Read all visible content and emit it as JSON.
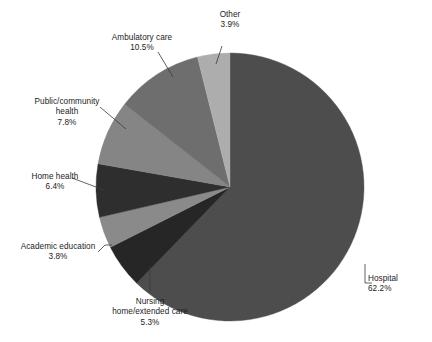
{
  "chart_data": {
    "type": "pie",
    "title": "",
    "subtitle": "",
    "xlabel": "",
    "ylabel": "",
    "legend_position": "none",
    "grid": false,
    "label_style": "external-with-leader-lines",
    "value_unit": "%",
    "start_angle_deg": 0,
    "direction": "clockwise",
    "categories": [
      "Hospital",
      "Nursing home/extended care",
      "Academic education",
      "Home health",
      "Public/community health",
      "Ambulatory care",
      "Other"
    ],
    "values": [
      62.2,
      5.3,
      3.8,
      6.4,
      7.8,
      10.5,
      3.9
    ],
    "colors": [
      "#4d4d4d",
      "#262626",
      "#8a8a8a",
      "#2e2e2e",
      "#858585",
      "#6e6e6e",
      "#adadad"
    ],
    "slices": [
      {
        "label": "Hospital",
        "label_lines": [
          "Hospital",
          "62.2%"
        ],
        "value": 62.2,
        "value_text": "62.2%",
        "color": "#4d4d4d"
      },
      {
        "label": "Nursing home/extended care",
        "label_lines": [
          "Nursing",
          "home/extended care",
          "5.3%"
        ],
        "value": 5.3,
        "value_text": "5.3%",
        "color": "#262626"
      },
      {
        "label": "Academic education",
        "label_lines": [
          "Academic education",
          "3.8%"
        ],
        "value": 3.8,
        "value_text": "3.8%",
        "color": "#8a8a8a"
      },
      {
        "label": "Home health",
        "label_lines": [
          "Home health",
          "6.4%"
        ],
        "value": 6.4,
        "value_text": "6.4%",
        "color": "#2e2e2e"
      },
      {
        "label": "Public/community health",
        "label_lines": [
          "Public/community",
          "health",
          "7.8%"
        ],
        "value": 7.8,
        "value_text": "7.8%",
        "color": "#858585"
      },
      {
        "label": "Ambulatory care",
        "label_lines": [
          "Ambulatory care",
          "10.5%"
        ],
        "value": 10.5,
        "value_text": "10.5%",
        "color": "#6e6e6e"
      },
      {
        "label": "Other",
        "label_lines": [
          "Other",
          "3.9%"
        ],
        "value": 3.9,
        "value_text": "3.9%",
        "color": "#adadad"
      }
    ]
  },
  "labels": {
    "hospital": {
      "line1": "Hospital",
      "line2": "62.2%"
    },
    "nursing": {
      "line1": "Nursing",
      "line2": "home/extended care",
      "line3": "5.3%"
    },
    "academic": {
      "line1": "Academic education",
      "line2": "3.8%"
    },
    "home": {
      "line1": "Home health",
      "line2": "6.4%"
    },
    "public": {
      "line1": "Public/community",
      "line2": "health",
      "line3": "7.8%"
    },
    "ambulatory": {
      "line1": "Ambulatory care",
      "line2": "10.5%"
    },
    "other": {
      "line1": "Other",
      "line2": "3.9%"
    }
  },
  "geometry": {
    "center_x": 230,
    "center_y": 187,
    "radius": 134
  },
  "style": {
    "background": "#ffffff",
    "text_color": "#1c1c1c",
    "leader_line_color": "#3a3a3a"
  }
}
